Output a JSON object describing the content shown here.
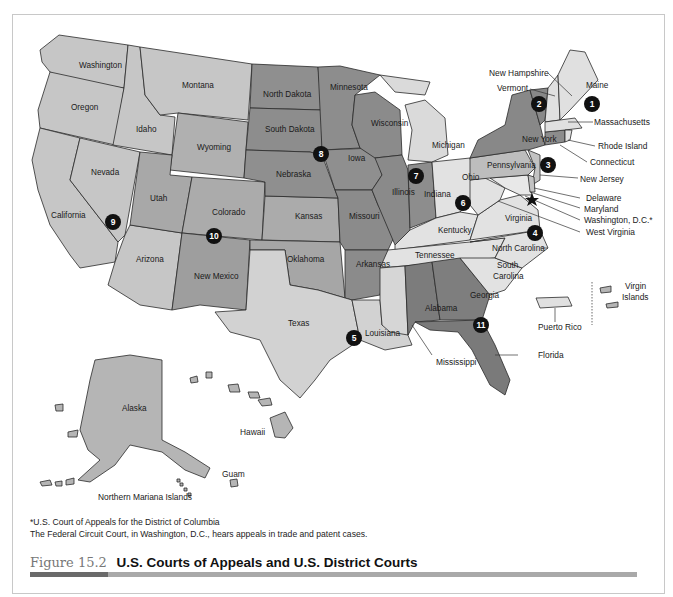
{
  "figure": {
    "number": "Figure 15.2",
    "title": "U.S. Courts of Appeals and U.S. District Courts"
  },
  "footnotes": [
    "*U.S. Court of Appeals for the District of Columbia",
    "The Federal Circuit Court, in Washington, D.C., hears appeals in trade and patent cases."
  ],
  "colors": {
    "light": "#d9d9d9",
    "lighter": "#e6e6e6",
    "mid": "#b5b5b5",
    "midlight": "#c6c6c6",
    "dark": "#8d8d8d",
    "darker": "#7a7a7a",
    "marker": "#111111",
    "border": "#2a2a2a"
  },
  "states": {
    "washington": "Washington",
    "oregon": "Oregon",
    "california": "California",
    "idaho": "Idaho",
    "nevada": "Nevada",
    "montana": "Montana",
    "wyoming": "Wyoming",
    "utah": "Utah",
    "colorado": "Colorado",
    "arizona": "Arizona",
    "new_mexico": "New Mexico",
    "north_dakota": "North Dakota",
    "south_dakota": "South Dakota",
    "nebraska": "Nebraska",
    "kansas": "Kansas",
    "oklahoma": "Oklahoma",
    "texas": "Texas",
    "minnesota": "Minnesota",
    "iowa": "Iowa",
    "missouri": "Missouri",
    "arkansas": "Arkansas",
    "louisiana": "Louisiana",
    "mississippi": "Mississippi",
    "wisconsin": "Wisconsin",
    "illinois": "Illinois",
    "indiana": "Indiana",
    "michigan": "Michigan",
    "ohio": "Ohio",
    "kentucky": "Kentucky",
    "tennessee": "Tennessee",
    "alabama": "Alabama",
    "georgia": "Georgia",
    "florida": "Florida",
    "south_carolina_1": "South",
    "south_carolina_2": "Carolina",
    "north_carolina": "North Carolina",
    "virginia": "Virginia",
    "west_virginia": "West Virginia",
    "pennsylvania": "Pennsylvania",
    "new_york": "New York",
    "new_jersey": "New Jersey",
    "delaware": "Delaware",
    "maryland": "Maryland",
    "washington_dc": "Washington, D.C.*",
    "vermont": "Vermont",
    "new_hampshire": "New Hampshire",
    "maine": "Maine",
    "massachusetts": "Massachusetts",
    "rhode_island": "Rhode Island",
    "connecticut": "Connecticut",
    "alaska": "Alaska",
    "hawaii": "Hawaii",
    "guam": "Guam",
    "northern_mariana_islands": "Northern Mariana Islands",
    "puerto_rico": "Puerto Rico",
    "virgin_islands_1": "Virgin",
    "virgin_islands_2": "Islands"
  },
  "circuits": [
    {
      "number": "1"
    },
    {
      "number": "2"
    },
    {
      "number": "3"
    },
    {
      "number": "4"
    },
    {
      "number": "5"
    },
    {
      "number": "6"
    },
    {
      "number": "7"
    },
    {
      "number": "8"
    },
    {
      "number": "9"
    },
    {
      "number": "10"
    },
    {
      "number": "11"
    }
  ]
}
